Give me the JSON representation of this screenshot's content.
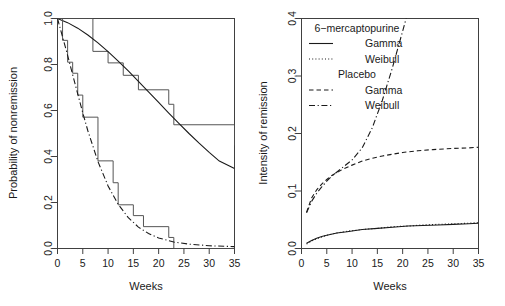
{
  "chart_data": [
    {
      "id": "left-panel",
      "type": "line",
      "title": "",
      "xlabel": "Weeks",
      "ylabel": "Probability of nonremission",
      "xlim": [
        0,
        35
      ],
      "ylim": [
        0.0,
        1.0
      ],
      "xticks": [
        0,
        5,
        10,
        15,
        20,
        25,
        30,
        35
      ],
      "xtick_labels": [
        "0",
        "5",
        "10",
        "15",
        "20",
        "25",
        "30",
        "35"
      ],
      "yticks": [
        0.0,
        0.2,
        0.4,
        0.6,
        0.8,
        1.0
      ],
      "ytick_labels": [
        "0.0",
        "0.2",
        "0.4",
        "0.6",
        "0.8",
        "1.0"
      ],
      "grid": false,
      "legend": "none",
      "series": [
        {
          "name": "6-mercaptopurine Kaplan-Meier step",
          "style": "step-solid",
          "x": [
            0,
            6,
            7,
            10,
            13,
            16,
            22,
            23,
            35
          ],
          "y": [
            1.0,
            1.0,
            0.857,
            0.807,
            0.753,
            0.69,
            0.627,
            0.538,
            0.448
          ]
        },
        {
          "name": "6-mercaptopurine fitted curve",
          "style": "solid",
          "x": [
            0,
            2,
            4,
            6,
            8,
            10,
            12,
            14,
            16,
            18,
            20,
            22,
            24,
            26,
            28,
            30,
            32,
            35
          ],
          "y": [
            1.0,
            0.982,
            0.958,
            0.928,
            0.894,
            0.856,
            0.815,
            0.772,
            0.727,
            0.681,
            0.635,
            0.589,
            0.544,
            0.5,
            0.458,
            0.418,
            0.38,
            0.348
          ]
        },
        {
          "name": "Placebo Kaplan-Meier step",
          "style": "step-solid",
          "x": [
            0,
            1,
            2,
            3,
            4,
            5,
            8,
            11,
            12,
            15,
            17,
            22,
            23,
            35
          ],
          "y": [
            1.0,
            0.905,
            0.81,
            0.762,
            0.667,
            0.571,
            0.381,
            0.286,
            0.19,
            0.143,
            0.095,
            0.048,
            0.0,
            0.0
          ]
        },
        {
          "name": "Placebo fitted curve",
          "style": "dashdot",
          "x": [
            0,
            1,
            2,
            3,
            4,
            5,
            6,
            8,
            10,
            12,
            14,
            16,
            18,
            20,
            23,
            26,
            30,
            35
          ],
          "y": [
            1.0,
            0.92,
            0.84,
            0.755,
            0.672,
            0.59,
            0.512,
            0.378,
            0.272,
            0.192,
            0.134,
            0.093,
            0.065,
            0.046,
            0.028,
            0.019,
            0.012,
            0.008
          ]
        }
      ]
    },
    {
      "id": "right-panel",
      "type": "line",
      "title": "",
      "xlabel": "Weeks",
      "ylabel": "Intensity of remission",
      "xlim": [
        0,
        35
      ],
      "ylim": [
        0.0,
        0.4
      ],
      "xticks": [
        0,
        5,
        10,
        15,
        20,
        25,
        30,
        35
      ],
      "xtick_labels": [
        "0",
        "5",
        "10",
        "15",
        "20",
        "25",
        "30",
        "35"
      ],
      "yticks": [
        0.0,
        0.1,
        0.2,
        0.3,
        0.4
      ],
      "ytick_labels": [
        "0.0",
        "0.1",
        "0.2",
        "0.3",
        "0.4"
      ],
      "grid": false,
      "legend": "top-center",
      "legend_entries": [
        {
          "label": "6-mercaptopurine",
          "style": "header"
        },
        {
          "label": "Gamma",
          "style": "solid"
        },
        {
          "label": "Weibull",
          "style": "dotted"
        },
        {
          "label": "Placebo",
          "style": "header"
        },
        {
          "label": "Gamma",
          "style": "dashed"
        },
        {
          "label": "Weibull",
          "style": "dashdot"
        }
      ],
      "series": [
        {
          "name": "6-mercaptopurine Gamma",
          "style": "solid",
          "x": [
            1,
            2,
            3,
            4,
            5,
            7,
            9,
            12,
            15,
            18,
            21,
            24,
            27,
            30,
            33,
            35
          ],
          "y": [
            0.009,
            0.014,
            0.018,
            0.021,
            0.023,
            0.027,
            0.029,
            0.033,
            0.035,
            0.037,
            0.039,
            0.04,
            0.041,
            0.042,
            0.043,
            0.044
          ]
        },
        {
          "name": "6-mercaptopurine Weibull",
          "style": "dotted",
          "x": [
            1,
            2,
            3,
            4,
            5,
            7,
            9,
            12,
            15,
            18,
            21,
            24,
            27,
            30,
            33,
            35
          ],
          "y": [
            0.008,
            0.013,
            0.017,
            0.02,
            0.023,
            0.027,
            0.03,
            0.033,
            0.035,
            0.038,
            0.039,
            0.041,
            0.042,
            0.043,
            0.044,
            0.045
          ]
        },
        {
          "name": "Placebo Gamma",
          "style": "dashed",
          "x": [
            1,
            2,
            3,
            4,
            5,
            6,
            8,
            10,
            12,
            14,
            16,
            18,
            20,
            23,
            26,
            30,
            33,
            35
          ],
          "y": [
            0.063,
            0.088,
            0.102,
            0.112,
            0.12,
            0.127,
            0.137,
            0.145,
            0.152,
            0.157,
            0.161,
            0.164,
            0.167,
            0.17,
            0.172,
            0.174,
            0.175,
            0.176
          ]
        },
        {
          "name": "Placebo Weibull",
          "style": "dashdot",
          "x": [
            1,
            2,
            3,
            4,
            5,
            6,
            8,
            10,
            12,
            14,
            16,
            18,
            20,
            21
          ],
          "y": [
            0.062,
            0.082,
            0.096,
            0.107,
            0.117,
            0.126,
            0.14,
            0.154,
            0.175,
            0.21,
            0.258,
            0.315,
            0.378,
            0.41
          ]
        }
      ]
    }
  ]
}
